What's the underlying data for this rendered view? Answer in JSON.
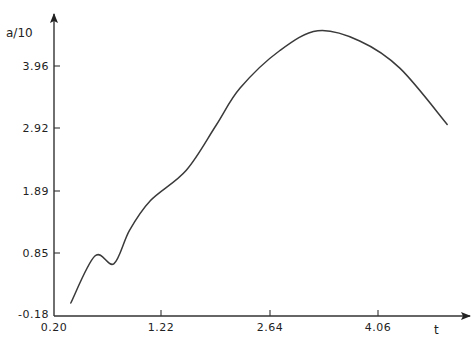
{
  "chart_data": {
    "type": "line",
    "title": "",
    "xlabel": "t",
    "ylabel": "a/10",
    "x_ticks": [
      "0.20",
      "1.22",
      "2.64",
      "4.06"
    ],
    "y_ticks": [
      "-0.18",
      "0.85",
      "1.89",
      "2.92",
      "3.96"
    ],
    "grid": false,
    "legend": null,
    "xlim": [
      0.2,
      5.0
    ],
    "ylim": [
      -0.18,
      4.6
    ],
    "series": [
      {
        "name": "a/10",
        "color": "#3a3a3a",
        "x": [
          0.36,
          0.59,
          0.77,
          0.92,
          1.12,
          1.55,
          1.94,
          2.25,
          2.77,
          3.27,
          3.82,
          4.35,
          4.97
        ],
        "y": [
          0.02,
          0.8,
          0.67,
          1.23,
          1.73,
          2.23,
          2.97,
          3.59,
          4.22,
          4.55,
          4.38,
          3.92,
          2.98
        ]
      }
    ],
    "annotations": []
  },
  "axes": {
    "x": {
      "label": "t",
      "ticks": [
        {
          "label": "0.20",
          "px": 54
        },
        {
          "label": "1.22",
          "px": 161
        },
        {
          "label": "2.64",
          "px": 270
        },
        {
          "label": "4.06",
          "px": 378
        }
      ]
    },
    "y": {
      "label": "a/10",
      "ticks": [
        {
          "label": "-0.18",
          "px": 315
        },
        {
          "label": "0.85",
          "px": 253
        },
        {
          "label": "1.89",
          "px": 191
        },
        {
          "label": "2.92",
          "px": 128
        },
        {
          "label": "3.96",
          "px": 66
        }
      ]
    }
  }
}
